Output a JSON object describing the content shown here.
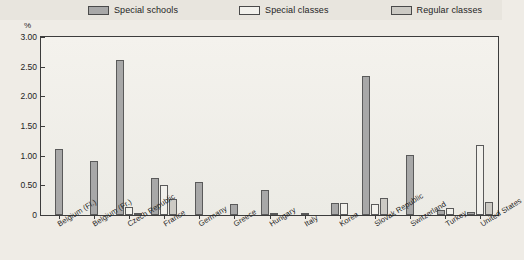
{
  "legend": {
    "items": [
      {
        "label": "Special schools",
        "color": "#a8a8a8",
        "key": "special_schools"
      },
      {
        "label": "Special classes",
        "color": "#f2f1ec",
        "key": "special_classes"
      },
      {
        "label": "Regular classes",
        "color": "#cccac4",
        "key": "regular_classes"
      }
    ]
  },
  "axis": {
    "unit_label": "%",
    "yticks": [
      "0",
      "0.50",
      "1.00",
      "1.50",
      "2.00",
      "2.50",
      "3.00"
    ]
  },
  "chart_data": {
    "type": "bar",
    "title": "",
    "xlabel": "",
    "ylabel": "%",
    "ylim": [
      0,
      3.0
    ],
    "ytick_values": [
      0,
      0.5,
      1.0,
      1.5,
      2.0,
      2.5,
      3.0
    ],
    "grid": false,
    "legend_position": "top",
    "categories": [
      "Belgium (Fl.)",
      "Belgium (Fr.)",
      "Czech Republic",
      "France",
      "Germany",
      "Greece",
      "Hungary",
      "Italy",
      "Korea",
      "Slovak Republic",
      "Switzerland",
      "Turkey",
      "United States"
    ],
    "series": [
      {
        "name": "Special schools",
        "color": "#a8a8a8",
        "values": [
          1.12,
          0.91,
          2.62,
          0.62,
          0.56,
          0.18,
          0.42,
          0.03,
          0.2,
          2.34,
          1.01,
          0.09,
          0.05
        ]
      },
      {
        "name": "Special classes",
        "color": "#f2f1ec",
        "values": [
          0.0,
          0.0,
          0.14,
          0.5,
          0.0,
          0.0,
          0.04,
          0.0,
          0.2,
          0.19,
          0.0,
          0.11,
          1.18
        ]
      },
      {
        "name": "Regular classes",
        "color": "#cccac4",
        "values": [
          0.0,
          0.0,
          0.03,
          0.27,
          0.0,
          0.0,
          0.0,
          0.0,
          0.0,
          0.28,
          0.0,
          0.0,
          0.22
        ]
      }
    ]
  }
}
